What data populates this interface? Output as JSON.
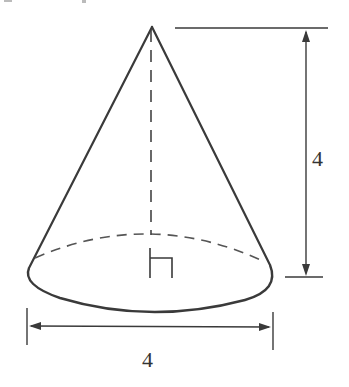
{
  "figure": {
    "shape": "right circular cone",
    "labels": {
      "height": "4",
      "diameter": "4"
    },
    "colors": {
      "stroke": "#3a3a3a",
      "background": "#ffffff"
    },
    "annotations": [
      "right-angle-marker",
      "dashed-height-line",
      "dashed-back-base-edge"
    ]
  }
}
